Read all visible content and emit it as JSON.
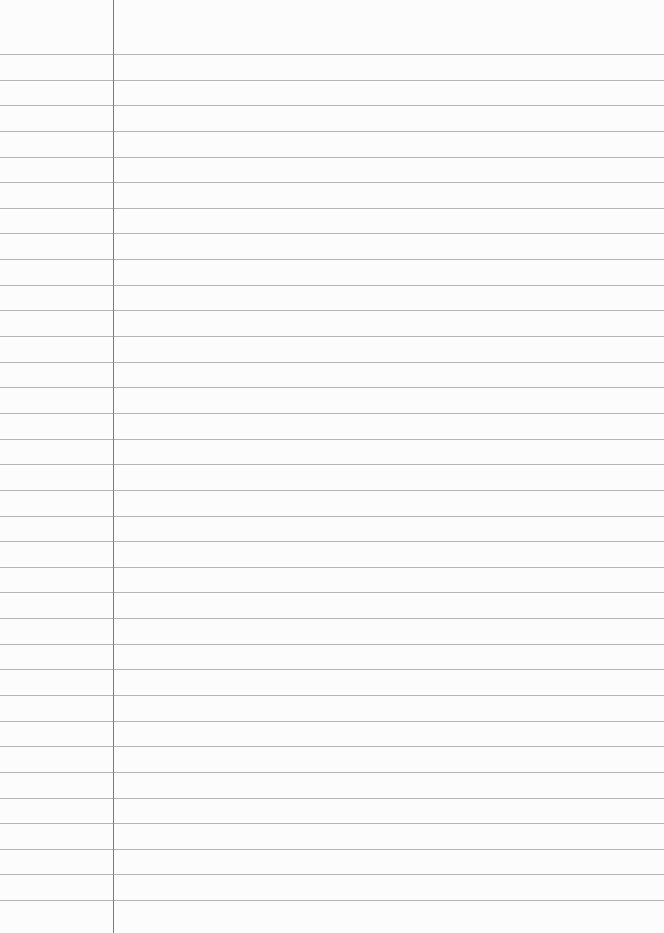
{
  "paper": {
    "type": "lined-notebook-page",
    "background_color": "#fcfcfc",
    "rule_color": "#a8a8a8",
    "margin_color": "#7a7a7a",
    "margin_x": 113,
    "first_rule_y": 54,
    "rule_spacing": 25.64,
    "rule_count": 34
  }
}
